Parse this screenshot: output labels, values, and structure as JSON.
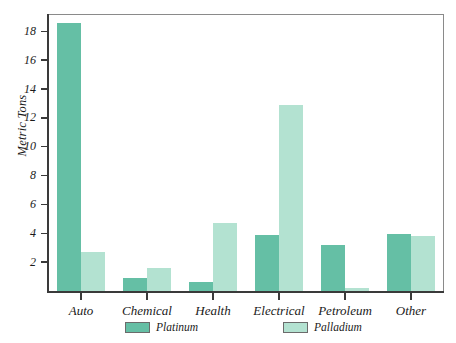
{
  "chart_data": {
    "type": "bar",
    "title": "",
    "subtitle": "",
    "xlabel": "",
    "ylabel": "Metric Tons",
    "categories": [
      "Auto",
      "Chemical",
      "Health",
      "Electrical",
      "Petroleum",
      "Other"
    ],
    "series": [
      {
        "name": "Platinum",
        "color": "#65bfa5",
        "values": [
          18.6,
          0.9,
          0.6,
          3.9,
          3.2,
          3.95
        ]
      },
      {
        "name": "Palladium",
        "color": "#b3e2d1",
        "values": [
          2.7,
          1.6,
          4.7,
          12.9,
          0.2,
          3.8
        ]
      }
    ],
    "ylim": [
      0,
      19.2
    ],
    "yticks": [
      2,
      4,
      6,
      8,
      10,
      12,
      14,
      16,
      18
    ],
    "ytick_labels": [
      "2",
      "4",
      "6",
      "8",
      "10",
      "12",
      "14",
      "16",
      "18"
    ],
    "grid": false,
    "legend_position": "bottom",
    "legend": [
      "Platinum",
      "Palladium"
    ]
  },
  "colors": {
    "platinum": "#65bfa5",
    "palladium": "#b3e2d1",
    "axis": "#3a3a3a",
    "frame": "#8a8a8a",
    "text": "#1a1a1a",
    "background": "#ffffff"
  }
}
